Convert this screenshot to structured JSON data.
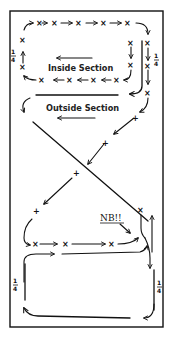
{
  "diagram": {
    "title": "",
    "labels": {
      "inside_section": "Inside Section",
      "outside_section": "Outside Section",
      "note": "NB!!"
    },
    "fractions": {
      "top_left": {
        "num": "1",
        "den": "4"
      },
      "top_right": {
        "num": "1",
        "den": "4"
      },
      "bottom_left": {
        "num": "1",
        "den": "4"
      },
      "bottom_right": {
        "num": "1",
        "den": "4"
      }
    },
    "markers": {
      "cross_x": "×",
      "cross_plus": "+"
    },
    "colors": {
      "ink": "#111111",
      "background": "#ffffff"
    }
  }
}
